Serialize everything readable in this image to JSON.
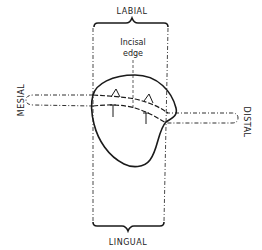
{
  "diagram": {
    "labels": {
      "labial": "LABIAL",
      "lingual": "LINGUAL",
      "mesial": "MESIAL",
      "distal": "DISTAL",
      "incisal_line1": "Incisal",
      "incisal_line2": "edge"
    },
    "colors": {
      "stroke": "#1a1a1a",
      "background": "#ffffff"
    }
  }
}
